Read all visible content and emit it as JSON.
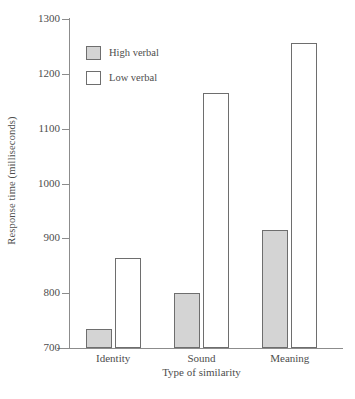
{
  "chart_data": {
    "type": "bar",
    "title": "",
    "subtitle": "",
    "xlabel": "Type of similarity",
    "ylabel": "Response time (milliseconds)",
    "categories": [
      "Identity",
      "Sound",
      "Meaning"
    ],
    "series": [
      {
        "name": "High verbal",
        "values": [
          735,
          800,
          915
        ],
        "fill": "#d4d4d4",
        "stroke": "#6e6e6e"
      },
      {
        "name": "Low verbal",
        "values": [
          865,
          1165,
          1257
        ],
        "fill": "#ffffff",
        "stroke": "#6e6e6e"
      }
    ],
    "ylim": [
      700,
      1300
    ],
    "yticks": [
      700,
      800,
      900,
      1000,
      1100,
      1200,
      1300
    ],
    "ytick_labels": [
      "700",
      "800",
      "900",
      "1000",
      "1100",
      "1200",
      "1300"
    ],
    "grid": false,
    "legend_position": "top-left",
    "axis_color": "#8c8c8c",
    "text_color": "#4d4d4d",
    "background": "#ffffff"
  }
}
